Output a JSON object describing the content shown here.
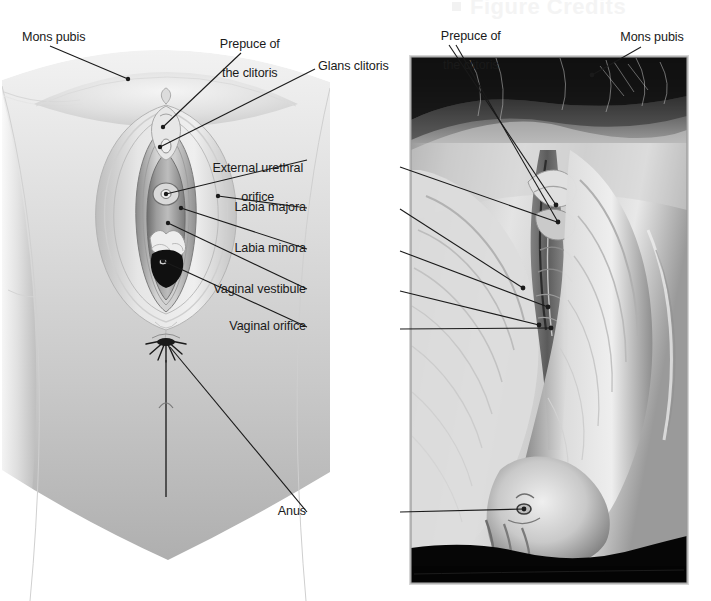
{
  "figure": {
    "type": "anatomical-figure",
    "title_watermark": "Figure Credits",
    "background_color": "#ffffff",
    "leader_color": "#1a1a1a",
    "text_color": "#1a1a1a",
    "panels": [
      {
        "id": "illustration",
        "kind": "line-art-illustration",
        "x": 0,
        "y": 55,
        "w": 330,
        "h": 546
      },
      {
        "id": "photograph",
        "kind": "grayscale-photograph",
        "x": 411,
        "y": 57,
        "w": 276,
        "h": 526
      }
    ]
  },
  "labels": {
    "illustration": [
      {
        "id": "mons-pubis-left",
        "text": "Mons pubis",
        "lines": [
          "Mons pubis"
        ],
        "align": "left",
        "x": 22,
        "y": 30,
        "dot": [
          128,
          79
        ]
      },
      {
        "id": "prepuce-left",
        "text": "Prepuce of the clitoris",
        "lines": [
          "Prepuce of",
          "the clitoris"
        ],
        "align": "center",
        "x": 216,
        "y": 22,
        "dot": [
          162,
          128
        ]
      },
      {
        "id": "glans-clitoris",
        "text": "Glans clitoris",
        "lines": [
          "Glans clitoris"
        ],
        "align": "left",
        "x": 318,
        "y": 59,
        "dot": [
          159,
          147
        ]
      },
      {
        "id": "external-urethral",
        "text": "External urethral orifice",
        "lines": [
          "External urethral",
          "orifice"
        ],
        "align": "right",
        "x": 310,
        "y": 146,
        "dot": [
          164,
          194
        ]
      },
      {
        "id": "labia-majora",
        "text": "Labia majora",
        "lines": [
          "Labia majora"
        ],
        "align": "right",
        "x": 310,
        "y": 200,
        "dot": [
          217,
          196
        ]
      },
      {
        "id": "labia-minora",
        "text": "Labia minora",
        "lines": [
          "Labia minora"
        ],
        "align": "right",
        "x": 310,
        "y": 241,
        "dot": [
          180,
          207
        ]
      },
      {
        "id": "vaginal-vestibule",
        "text": "Vaginal vestibule",
        "lines": [
          "Vaginal vestibule"
        ],
        "align": "right",
        "x": 310,
        "y": 282,
        "dot": [
          167,
          222
        ]
      },
      {
        "id": "vaginal-orifice",
        "text": "Vaginal orifice",
        "lines": [
          "Vaginal orifice"
        ],
        "align": "right",
        "x": 310,
        "y": 319,
        "dot": [
          161,
          261
        ]
      },
      {
        "id": "anus",
        "text": "Anus",
        "lines": [
          "Anus"
        ],
        "align": "right",
        "x": 310,
        "y": 504,
        "dot": [
          168,
          345
        ]
      }
    ],
    "photograph": [
      {
        "id": "prepuce-right",
        "text": "Prepuce of the clitoris",
        "lines": [
          "Prepuce of",
          "the clitoris"
        ],
        "align": "center",
        "x": 418,
        "y": 14,
        "dot": [
          563,
          205
        ]
      },
      {
        "id": "mons-pubis-right",
        "text": "Mons pubis",
        "lines": [
          "Mons pubis"
        ],
        "align": "center",
        "x": 611,
        "y": 30,
        "dot": [
          592,
          75
        ]
      }
    ]
  },
  "leader_lines": {
    "illustration": [
      {
        "label": "mons-pubis-left",
        "from": [
          50,
          46
        ],
        "to": [
          128,
          79
        ]
      },
      {
        "label": "prepuce-left",
        "from": [
          241,
          53
        ],
        "to": [
          162,
          128
        ]
      },
      {
        "label": "glans-clitoris",
        "from": [
          315,
          69
        ],
        "to": [
          160,
          147
        ]
      },
      {
        "label": "external-urethral",
        "from": [
          307,
          160
        ],
        "to": [
          165,
          194
        ]
      },
      {
        "label": "labia-majora",
        "from": [
          307,
          208
        ],
        "to": [
          217,
          196
        ]
      },
      {
        "label": "labia-minora",
        "from": [
          307,
          249
        ],
        "to": [
          181,
          207
        ]
      },
      {
        "label": "vaginal-vestibule",
        "from": [
          307,
          289
        ],
        "to": [
          168,
          223
        ]
      },
      {
        "label": "vaginal-orifice",
        "from": [
          307,
          327
        ],
        "to": [
          162,
          261
        ]
      },
      {
        "label": "anus",
        "from": [
          307,
          512
        ],
        "to": [
          169,
          346
        ]
      }
    ],
    "photograph": [
      {
        "label": "prepuce-right-a",
        "from": [
          449,
          45
        ],
        "to": [
          556,
          205
        ]
      },
      {
        "label": "prepuce-right-b",
        "from": [
          456,
          45
        ],
        "to": [
          558,
          222
        ]
      },
      {
        "label": "mons-pubis-right",
        "from": [
          641,
          47
        ],
        "to": [
          592,
          75
        ]
      },
      {
        "label": "urethral-photo",
        "from": [
          400,
          167
        ],
        "to": [
          558,
          222
        ]
      },
      {
        "label": "majora-photo",
        "from": [
          400,
          209
        ],
        "to": [
          523,
          287
        ]
      },
      {
        "label": "minora-photo",
        "from": [
          400,
          251
        ],
        "to": [
          548,
          306
        ]
      },
      {
        "label": "vestibule-photo",
        "from": [
          400,
          291
        ],
        "to": [
          538,
          325
        ]
      },
      {
        "label": "orifice-photo",
        "from": [
          400,
          329
        ],
        "to": [
          551,
          328
        ]
      },
      {
        "label": "anus-photo",
        "from": [
          400,
          512
        ],
        "to": [
          524,
          509
        ]
      }
    ]
  }
}
